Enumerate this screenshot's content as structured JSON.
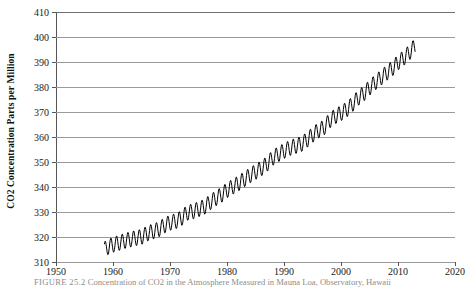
{
  "figure": {
    "caption_label": "FIGURE 25.2",
    "caption_text": "Concentration of CO2 in the Atmosphere Measured in Mauna Loa, Observatory, Hawaii"
  },
  "chart_data": {
    "type": "line",
    "title": "",
    "xlabel": "",
    "ylabel": "CO2 Concentration Parts per Million",
    "xlim": [
      1950,
      2020
    ],
    "ylim": [
      310,
      410
    ],
    "xticks": [
      1950,
      1960,
      1970,
      1980,
      1990,
      2000,
      2010,
      2020
    ],
    "yticks": [
      310,
      320,
      330,
      340,
      350,
      360,
      370,
      380,
      390,
      400,
      410
    ],
    "grid": "horizontal",
    "legend": "none",
    "line_color": "#000000",
    "grid_color": "#9a9a9a",
    "axis_color": "#555555",
    "series": [
      {
        "name": "CO2 annual mean (Mauna Loa)",
        "seasonal_amplitude": 3.1,
        "x": [
          1958.5,
          1959,
          1960,
          1961,
          1962,
          1963,
          1964,
          1965,
          1966,
          1967,
          1968,
          1969,
          1970,
          1971,
          1972,
          1973,
          1974,
          1975,
          1976,
          1977,
          1978,
          1979,
          1980,
          1981,
          1982,
          1983,
          1984,
          1985,
          1986,
          1987,
          1988,
          1989,
          1990,
          1991,
          1992,
          1993,
          1994,
          1995,
          1996,
          1997,
          1998,
          1999,
          2000,
          2001,
          2002,
          2003,
          2004,
          2005,
          2006,
          2007,
          2008,
          2009,
          2010,
          2011,
          2012,
          2013
        ],
        "values": [
          315.0,
          315.9,
          316.9,
          317.6,
          318.4,
          319.0,
          319.6,
          320.0,
          321.4,
          322.2,
          323.0,
          324.6,
          325.7,
          326.3,
          327.5,
          329.7,
          330.2,
          331.1,
          332.0,
          333.8,
          335.4,
          336.8,
          338.7,
          340.1,
          341.4,
          343.0,
          344.6,
          346.0,
          347.4,
          349.2,
          351.6,
          353.1,
          354.4,
          355.6,
          356.4,
          357.1,
          358.8,
          360.8,
          362.6,
          363.7,
          366.6,
          368.3,
          369.5,
          371.0,
          373.1,
          375.6,
          377.4,
          379.7,
          381.8,
          383.7,
          385.6,
          387.4,
          389.8,
          391.6,
          393.8,
          396.5
        ]
      }
    ]
  }
}
